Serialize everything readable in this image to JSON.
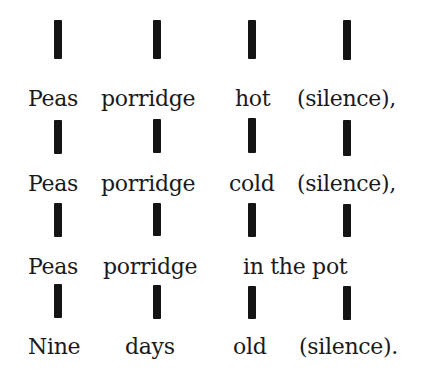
{
  "rhyme": {
    "beat_color": "#141414",
    "lines": [
      {
        "words": [
          "Peas",
          "porridge",
          "hot",
          "(silence),"
        ]
      },
      {
        "words": [
          "Peas",
          "porridge",
          "cold",
          "(silence),"
        ]
      },
      {
        "words": [
          "Peas",
          "porridge",
          "in the pot"
        ]
      },
      {
        "words": [
          "Nine",
          "days",
          "old",
          "(silence)."
        ]
      }
    ],
    "beats_per_line": 4
  }
}
